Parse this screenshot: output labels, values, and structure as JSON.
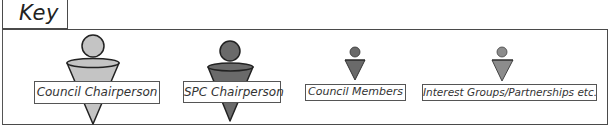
{
  "key": {
    "title": "Key"
  },
  "legend": {
    "items": [
      {
        "label": "Council Chairperson",
        "fill": "#c4c4c4",
        "size": "large"
      },
      {
        "label": "SPC Chairperson",
        "fill": "#6a6a6a",
        "size": "large"
      },
      {
        "label": "Council Members",
        "fill": "#6a6a6a",
        "size": "small"
      },
      {
        "label": "Interest Groups/Partnerships etc.",
        "fill": "#8c8c8c",
        "size": "small"
      }
    ]
  },
  "colors": {
    "border": "#4a4a4a",
    "outline": "#222222"
  }
}
